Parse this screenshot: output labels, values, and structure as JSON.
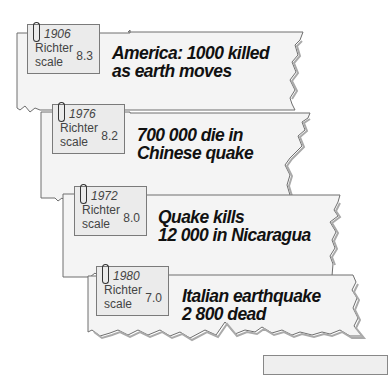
{
  "clippings": [
    {
      "year": "1906",
      "scale_line1": "Richter",
      "scale_line2": "scale",
      "magnitude": "8.3",
      "headline_line1": "America: 1000 killed",
      "headline_line2": "as earth moves"
    },
    {
      "year": "1976",
      "scale_line1": "Richter",
      "scale_line2": "scale",
      "magnitude": "8.2",
      "headline_line1": "700 000 die in",
      "headline_line2": "Chinese quake"
    },
    {
      "year": "1972",
      "scale_line1": "Richter",
      "scale_line2": "scale",
      "magnitude": "8.0",
      "headline_line1": "Quake kills",
      "headline_line2": "12 000 in Nicaragua"
    },
    {
      "year": "1980",
      "scale_line1": "Richter",
      "scale_line2": "scale",
      "magnitude": "7.0",
      "headline_line1": "Italian earthquake",
      "headline_line2": "2 800 dead"
    }
  ],
  "colors": {
    "paper": "#f4f4f4",
    "card": "#ebebeb",
    "border": "#6e6e6e",
    "headline": "#111111"
  }
}
